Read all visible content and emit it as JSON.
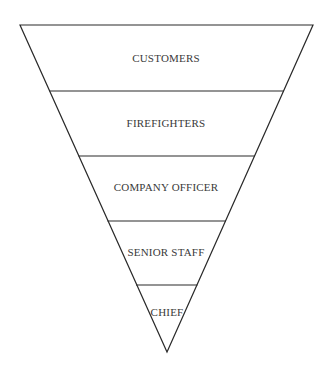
{
  "diagram": {
    "type": "inverted-pyramid",
    "colors": {
      "line": "#2a2a2a",
      "text": "#3a3a3a",
      "background": "#ffffff"
    },
    "levels": [
      {
        "label": "CUSTOMERS"
      },
      {
        "label": "FIREFIGHTERS"
      },
      {
        "label": "COMPANY OFFICER"
      },
      {
        "label": "SENIOR STAFF"
      },
      {
        "label": "CHIEF"
      }
    ]
  }
}
